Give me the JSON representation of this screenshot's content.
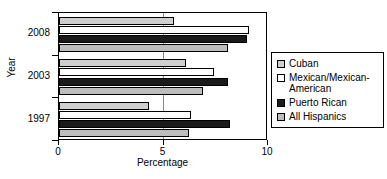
{
  "chart_data": {
    "type": "bar",
    "orientation": "horizontal",
    "title": "",
    "xlabel": "Percentage",
    "ylabel": "Year",
    "categories": [
      "2008",
      "2003",
      "1997"
    ],
    "xlim": [
      0,
      10
    ],
    "xticks": [
      0,
      5,
      10
    ],
    "xtick_labels": [
      "0",
      "5",
      "10"
    ],
    "grid": true,
    "legend_position": "right",
    "series": [
      {
        "name": "Cuban",
        "color": "#cfcfcf",
        "swatch": "light-gray",
        "values": [
          5.5,
          6.1,
          4.3
        ]
      },
      {
        "name": "Mexican/Mexican-American",
        "color": "#ffffff",
        "swatch": "white",
        "values": [
          9.1,
          7.4,
          6.3
        ]
      },
      {
        "name": "Puerto Rican",
        "color": "#1a1a1a",
        "swatch": "black",
        "values": [
          9.0,
          8.1,
          8.2
        ]
      },
      {
        "name": "All Hispanics",
        "color": "#bdbdbd",
        "swatch": "gray",
        "values": [
          8.1,
          6.9,
          6.2
        ]
      }
    ]
  },
  "legend": {
    "entries": [
      {
        "label": "Cuban"
      },
      {
        "label": "Mexican/Mexican-American"
      },
      {
        "label": "Puerto Rican"
      },
      {
        "label": "All Hispanics"
      }
    ]
  }
}
